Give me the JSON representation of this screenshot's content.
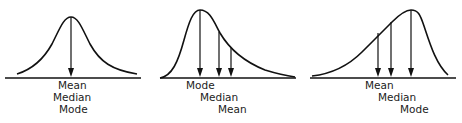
{
  "diagram": {
    "panels": [
      {
        "name": "symmetric",
        "labels": [
          "Mean",
          "Median",
          "Mode"
        ],
        "arrows": 1
      },
      {
        "name": "positively-skewed",
        "labels": [
          "Mode",
          "Median",
          "Mean"
        ],
        "arrows": 3
      },
      {
        "name": "negatively-skewed",
        "labels": [
          "Mean",
          "Median",
          "Mode"
        ],
        "arrows": 3
      }
    ]
  }
}
